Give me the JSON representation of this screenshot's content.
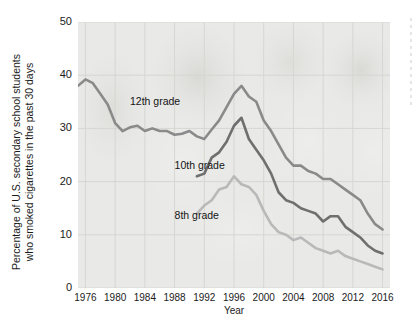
{
  "chart_data": {
    "type": "line",
    "title": "",
    "xlabel": "Year",
    "ylabel_line1": "Percentage of U.S. secondary school students",
    "ylabel_line2": "who smoked cigarettes in the past 30 days",
    "xlim": [
      1975,
      2017
    ],
    "ylim": [
      0,
      50
    ],
    "xticks": [
      1976,
      1980,
      1984,
      1988,
      1992,
      1996,
      2000,
      2004,
      2008,
      2012,
      2016
    ],
    "yticks": [
      0,
      10,
      20,
      30,
      40,
      50
    ],
    "grid": true,
    "legend_position": "inline-annotations",
    "series": [
      {
        "name": "12th grade",
        "color": "#8a8a8a",
        "label_x": 1982.0,
        "label_y": 35.0,
        "x": [
          1975,
          1976,
          1977,
          1978,
          1979,
          1980,
          1981,
          1982,
          1983,
          1984,
          1985,
          1986,
          1987,
          1988,
          1989,
          1990,
          1991,
          1992,
          1993,
          1994,
          1995,
          1996,
          1997,
          1998,
          1999,
          2000,
          2001,
          2002,
          2003,
          2004,
          2005,
          2006,
          2007,
          2008,
          2009,
          2010,
          2011,
          2012,
          2013,
          2014,
          2015,
          2016
        ],
        "y": [
          38.0,
          39.2,
          38.5,
          36.5,
          34.5,
          31.0,
          29.5,
          30.2,
          30.5,
          29.5,
          30.0,
          29.5,
          29.5,
          28.8,
          29.0,
          29.5,
          28.5,
          28.0,
          29.8,
          31.5,
          34.0,
          36.5,
          38.0,
          36.0,
          35.0,
          31.5,
          29.5,
          27.0,
          24.5,
          23.0,
          23.0,
          22.0,
          21.5,
          20.5,
          20.5,
          19.5,
          18.5,
          17.5,
          16.5,
          14.0,
          12.0,
          11.0
        ]
      },
      {
        "name": "10th grade",
        "color": "#6f6f6f",
        "label_x": 1988.0,
        "label_y": 23.0,
        "x": [
          1991,
          1992,
          1993,
          1994,
          1995,
          1996,
          1997,
          1998,
          1999,
          2000,
          2001,
          2002,
          2003,
          2004,
          2005,
          2006,
          2007,
          2008,
          2009,
          2010,
          2011,
          2012,
          2013,
          2014,
          2015,
          2016
        ],
        "y": [
          21.0,
          21.5,
          24.5,
          25.5,
          27.5,
          30.5,
          32.0,
          28.0,
          26.0,
          24.0,
          21.5,
          18.0,
          16.5,
          16.0,
          15.0,
          14.5,
          14.0,
          12.5,
          13.5,
          13.5,
          11.5,
          10.5,
          9.5,
          8.0,
          7.0,
          6.5
        ]
      },
      {
        "name": "8th grade",
        "color": "#b9b9b9",
        "label_x": 1988.0,
        "label_y": 13.5,
        "x": [
          1991,
          1992,
          1993,
          1994,
          1995,
          1996,
          1997,
          1998,
          1999,
          2000,
          2001,
          2002,
          2003,
          2004,
          2005,
          2006,
          2007,
          2008,
          2009,
          2010,
          2011,
          2012,
          2013,
          2014,
          2015,
          2016
        ],
        "y": [
          14.0,
          15.5,
          16.5,
          18.5,
          19.0,
          21.0,
          19.5,
          19.0,
          17.5,
          14.5,
          12.0,
          10.5,
          10.0,
          9.0,
          9.5,
          8.5,
          7.5,
          7.0,
          6.5,
          7.0,
          6.0,
          5.5,
          5.0,
          4.5,
          4.0,
          3.5
        ]
      }
    ]
  }
}
